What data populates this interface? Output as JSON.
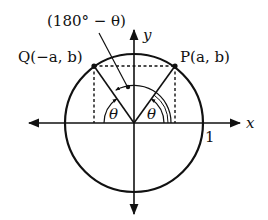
{
  "diagram": {
    "annotation_top": "(180° − θ)",
    "point_q_label": "Q(−a, b)",
    "point_p_label": "P(a, b)",
    "x_axis_label": "x",
    "y_axis_label": "y",
    "radius_label": "1",
    "angle_left_label": "θ",
    "angle_right_label": "θ",
    "stroke_color": "#111111",
    "background": "#ffffff"
  }
}
